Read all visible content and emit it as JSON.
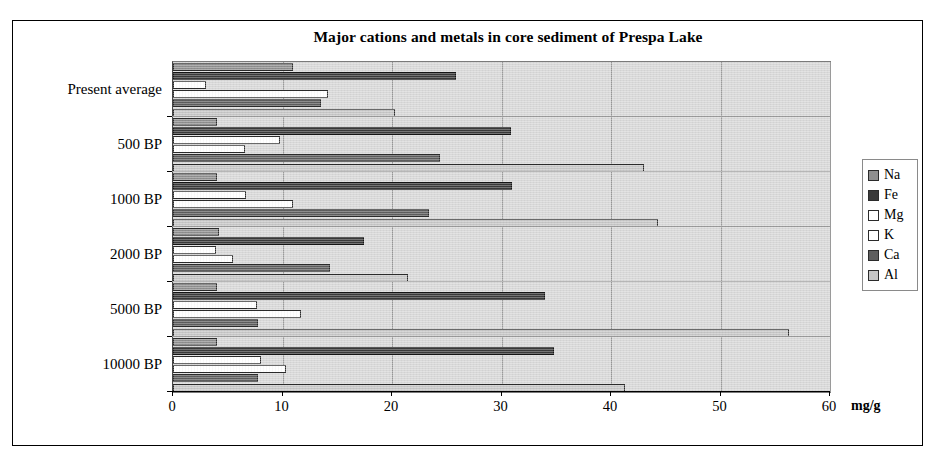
{
  "figure": {
    "title": "Major cations and metals in core sediment of Prespa Lake",
    "unit_label": "mg/g"
  },
  "chart_data": {
    "type": "bar",
    "orientation": "horizontal",
    "title": "Major cations and metals in core sediment of Prespa Lake",
    "xlabel": "mg/g",
    "ylabel": "",
    "xlim": [
      0,
      60
    ],
    "xticks": [
      0,
      10,
      20,
      30,
      40,
      50,
      60
    ],
    "xtick_labels": [
      "0",
      "10",
      "20",
      "30",
      "40",
      "50",
      "60"
    ],
    "grid": true,
    "legend_position": "right",
    "categories": [
      "Present average",
      "500 BP",
      "1000 BP",
      "2000 BP",
      "5000 BP",
      "10000 BP"
    ],
    "series": [
      {
        "name": "Na",
        "color": "#8f8f8f",
        "values": [
          11.0,
          4.0,
          4.0,
          4.2,
          4.0,
          4.0
        ]
      },
      {
        "name": "Fe",
        "color": "#3a3a3a",
        "values": [
          25.8,
          30.9,
          31.0,
          17.4,
          34.0,
          34.8
        ]
      },
      {
        "name": "Mg",
        "color": "#ffffff",
        "values": [
          3.0,
          9.8,
          6.7,
          3.9,
          7.7,
          8.0
        ]
      },
      {
        "name": "K",
        "color": "#ffffff",
        "values": [
          14.2,
          6.6,
          11.0,
          5.5,
          11.7,
          10.3
        ]
      },
      {
        "name": "Ca",
        "color": "#5e5e5e",
        "values": [
          13.5,
          24.4,
          23.4,
          14.3,
          7.8,
          7.8
        ]
      },
      {
        "name": "Al",
        "color": "#c6c6c6",
        "values": [
          20.3,
          43.0,
          44.3,
          21.5,
          56.3,
          41.3
        ]
      }
    ]
  },
  "legend": {
    "items": [
      {
        "label": "Na"
      },
      {
        "label": "Fe"
      },
      {
        "label": "Mg"
      },
      {
        "label": "K"
      },
      {
        "label": "Ca"
      },
      {
        "label": "Al"
      }
    ]
  }
}
